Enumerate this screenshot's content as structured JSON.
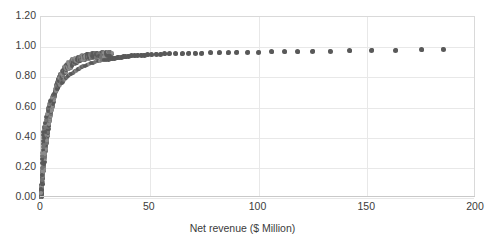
{
  "chart_data": {
    "type": "scatter",
    "title": "",
    "xlabel": "Net revenue ($ Million)",
    "ylabel": "",
    "xlim": [
      0,
      200
    ],
    "ylim": [
      0.0,
      1.2
    ],
    "grid": true,
    "legend": null,
    "marker_color": "#595959",
    "marker_color_light": "#8c8c8c",
    "x_ticks": [
      "0",
      "50",
      "100",
      "150",
      "200"
    ],
    "x_tick_values": [
      0,
      50,
      100,
      150,
      200
    ],
    "y_ticks": [
      "0.00",
      "0.20",
      "0.40",
      "0.60",
      "0.80",
      "1.00",
      "1.20"
    ],
    "y_tick_values": [
      0.0,
      0.2,
      0.4,
      0.6,
      0.8,
      1.0,
      1.2
    ],
    "points": [
      [
        0.15,
        0.03
      ],
      [
        0.2,
        0.06
      ],
      [
        0.25,
        0.09
      ],
      [
        0.3,
        0.12
      ],
      [
        0.35,
        0.15
      ],
      [
        0.4,
        0.18
      ],
      [
        0.45,
        0.2
      ],
      [
        0.5,
        0.23
      ],
      [
        0.55,
        0.26
      ],
      [
        0.6,
        0.28
      ],
      [
        0.65,
        0.3
      ],
      [
        0.7,
        0.32
      ],
      [
        0.75,
        0.34
      ],
      [
        0.8,
        0.36
      ],
      [
        0.85,
        0.38
      ],
      [
        0.9,
        0.4
      ],
      [
        1.0,
        0.42
      ],
      [
        1.1,
        0.44
      ],
      [
        1.2,
        0.46
      ],
      [
        1.3,
        0.47
      ],
      [
        1.4,
        0.3
      ],
      [
        1.5,
        0.35
      ],
      [
        1.6,
        0.4
      ],
      [
        1.7,
        0.44
      ],
      [
        1.8,
        0.47
      ],
      [
        1.9,
        0.49
      ],
      [
        2.0,
        0.5
      ],
      [
        2.2,
        0.52
      ],
      [
        2.4,
        0.54
      ],
      [
        2.6,
        0.55
      ],
      [
        2.8,
        0.56
      ],
      [
        3.0,
        0.58
      ],
      [
        3.2,
        0.59
      ],
      [
        3.4,
        0.6
      ],
      [
        3.6,
        0.61
      ],
      [
        3.8,
        0.62
      ],
      [
        4.0,
        0.63
      ],
      [
        4.3,
        0.64
      ],
      [
        4.6,
        0.65
      ],
      [
        4.9,
        0.66
      ],
      [
        5.2,
        0.67
      ],
      [
        5.5,
        0.68
      ],
      [
        5.8,
        0.685
      ],
      [
        6.1,
        0.69
      ],
      [
        6.4,
        0.7
      ],
      [
        6.8,
        0.71
      ],
      [
        7.2,
        0.72
      ],
      [
        7.6,
        0.73
      ],
      [
        8.0,
        0.74
      ],
      [
        8.4,
        0.745
      ],
      [
        8.8,
        0.75
      ],
      [
        9.2,
        0.76
      ],
      [
        9.6,
        0.765
      ],
      [
        10.0,
        0.77
      ],
      [
        10.5,
        0.78
      ],
      [
        11.0,
        0.79
      ],
      [
        11.5,
        0.795
      ],
      [
        12.0,
        0.8
      ],
      [
        12.5,
        0.81
      ],
      [
        13.0,
        0.815
      ],
      [
        13.5,
        0.82
      ],
      [
        14.0,
        0.825
      ],
      [
        14.5,
        0.83
      ],
      [
        15.0,
        0.835
      ],
      [
        15.5,
        0.84
      ],
      [
        16.0,
        0.845
      ],
      [
        16.5,
        0.85
      ],
      [
        17.0,
        0.855
      ],
      [
        17.5,
        0.858
      ],
      [
        18.0,
        0.862
      ],
      [
        18.5,
        0.866
      ],
      [
        19.0,
        0.87
      ],
      [
        19.5,
        0.873
      ],
      [
        20.0,
        0.876
      ],
      [
        21.0,
        0.882
      ],
      [
        22.0,
        0.888
      ],
      [
        23.0,
        0.893
      ],
      [
        24.0,
        0.898
      ],
      [
        25.0,
        0.902
      ],
      [
        26.0,
        0.906
      ],
      [
        27.0,
        0.909
      ],
      [
        28.0,
        0.912
      ],
      [
        29.0,
        0.915
      ],
      [
        30.0,
        0.918
      ],
      [
        31.0,
        0.921
      ],
      [
        32.0,
        0.924
      ],
      [
        33.0,
        0.926
      ],
      [
        34.0,
        0.928
      ],
      [
        35.0,
        0.93
      ],
      [
        36.0,
        0.932
      ],
      [
        37.0,
        0.934
      ],
      [
        38.0,
        0.936
      ],
      [
        39.0,
        0.938
      ],
      [
        40.0,
        0.94
      ],
      [
        41.5,
        0.942
      ],
      [
        43.0,
        0.944
      ],
      [
        44.5,
        0.946
      ],
      [
        46.0,
        0.947
      ],
      [
        47.5,
        0.948
      ],
      [
        49.0,
        0.95
      ],
      [
        51.0,
        0.951
      ],
      [
        53.0,
        0.952
      ],
      [
        55.0,
        0.953
      ],
      [
        57.0,
        0.955
      ],
      [
        59.0,
        0.956
      ],
      [
        62.0,
        0.957
      ],
      [
        65.0,
        0.958
      ],
      [
        68.0,
        0.959
      ],
      [
        71.0,
        0.96
      ],
      [
        74.0,
        0.961
      ],
      [
        78.0,
        0.962
      ],
      [
        82.0,
        0.963
      ],
      [
        86.0,
        0.964
      ],
      [
        90.0,
        0.965
      ],
      [
        95.0,
        0.966
      ],
      [
        100.0,
        0.967
      ],
      [
        106.0,
        0.968
      ],
      [
        112.0,
        0.969
      ],
      [
        118.0,
        0.97
      ],
      [
        125.0,
        0.972
      ],
      [
        133.0,
        0.974
      ],
      [
        142.0,
        0.976
      ],
      [
        152.0,
        0.978
      ],
      [
        163.0,
        0.98
      ],
      [
        175.0,
        0.982
      ],
      [
        185.0,
        0.985
      ]
    ],
    "dense_band": {
      "note": "Hundreds of overlapping markers form an opaque band along the rising curve below x=30.",
      "x_range": [
        0,
        32
      ],
      "y_range": [
        0.0,
        0.95
      ]
    }
  }
}
